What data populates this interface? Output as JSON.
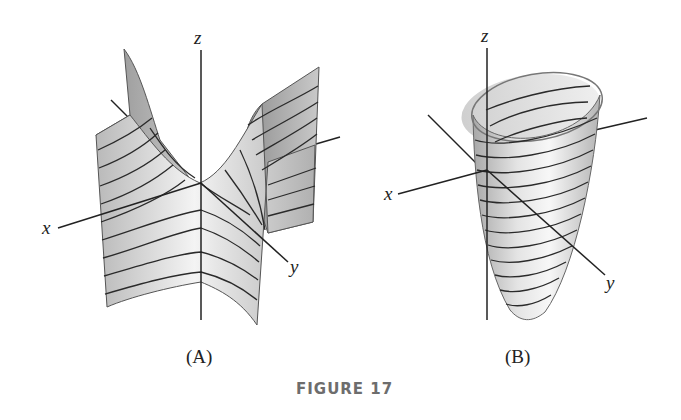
{
  "figure": {
    "caption": "FIGURE 17",
    "panels": [
      {
        "id": "A",
        "label": "(A)",
        "surface": "saddle (hyperbolic paraboloid) with horizontal contour lines",
        "axes": {
          "x": "x",
          "y": "y",
          "z": "z"
        }
      },
      {
        "id": "B",
        "label": "(B)",
        "surface": "elliptic paraboloid with horizontal contour rings",
        "axes": {
          "x": "x",
          "y": "y",
          "z": "z"
        }
      }
    ]
  },
  "colors": {
    "background": "#ffffff",
    "surface_light": "#f2f2f2",
    "surface_mid": "#c8c8c8",
    "surface_dark": "#9a9a9a",
    "line": "#222222",
    "caption": "#6d6d6d"
  }
}
